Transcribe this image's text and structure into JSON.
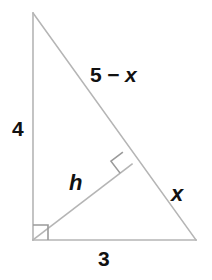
{
  "figure": {
    "stroke_color": "#b0b0b0",
    "text_color": "#111111",
    "background": "#ffffff",
    "vertices": {
      "apex": {
        "x": 33,
        "y": 13
      },
      "bottom_left": {
        "x": 33,
        "y": 240
      },
      "bottom_right": {
        "x": 196,
        "y": 240
      },
      "altitude_foot": {
        "x": 132,
        "y": 164
      }
    },
    "right_angle_markers": [
      {
        "name": "right-angle-at-bottom-left",
        "x": 33,
        "y": 225,
        "size": 15
      },
      {
        "name": "right-angle-at-altitude-foot",
        "x": 132,
        "y": 164,
        "size": 15
      }
    ],
    "labels": {
      "hypotenuse_upper": "5 − x",
      "hypotenuse_upper_number": "5",
      "hypotenuse_upper_operator": "−",
      "hypotenuse_upper_variable": "x",
      "vertical_leg": "4",
      "altitude": "h",
      "hypotenuse_lower": "x",
      "base_leg": "3"
    }
  }
}
